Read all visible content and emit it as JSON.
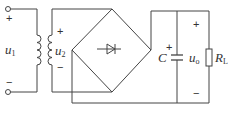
{
  "diagram": {
    "type": "bridge-rectifier-circuit",
    "stroke_color": "#444444",
    "labels": {
      "u1": {
        "main": "u",
        "sub": "1"
      },
      "u2": {
        "main": "u",
        "sub": "2"
      },
      "C": "C",
      "uo": {
        "main": "u",
        "sub": "o"
      },
      "RL": {
        "main": "R",
        "sub": "L"
      }
    },
    "signs": {
      "input_plus": "+",
      "input_minus": "−",
      "secondary_plus": "+",
      "secondary_minus": "−",
      "capacitor_plus": "+",
      "output_plus": "+",
      "output_minus": "−"
    },
    "components": [
      "transformer",
      "bridge-rectifier",
      "capacitor",
      "load-resistor"
    ]
  }
}
